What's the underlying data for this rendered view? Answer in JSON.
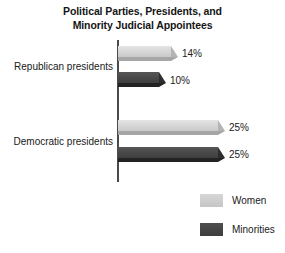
{
  "chart_data": {
    "type": "bar",
    "orientation": "horizontal",
    "title": "Political Parties, Presidents, and Minority Judicial Appointees",
    "title_lines": [
      "Political Parties, Presidents, and",
      "Minority Judicial Appointees"
    ],
    "categories": [
      "Republican presidents",
      "Democratic presidents"
    ],
    "series": [
      {
        "name": "Women",
        "values": [
          14,
          25
        ],
        "value_labels": [
          "14%",
          "25%"
        ],
        "color": "#d4d4d4"
      },
      {
        "name": "Minorities",
        "values": [
          10,
          25
        ],
        "value_labels": [
          "10%",
          "25%"
        ],
        "color": "#484848"
      }
    ],
    "xlabel": "",
    "ylabel": "",
    "xlim": [
      0,
      30
    ],
    "grid": false,
    "legend_position": "bottom-right",
    "units": "percent"
  },
  "legend": {
    "items": [
      {
        "label": "Women",
        "color": "#d4d4d4"
      },
      {
        "label": "Minorities",
        "color": "#484848"
      }
    ]
  }
}
